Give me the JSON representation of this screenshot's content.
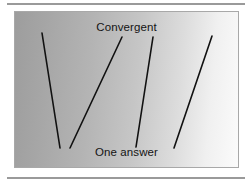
{
  "figure": {
    "type": "convergent-thinking-diagram",
    "top_label": "Convergent",
    "bottom_label": "One answer",
    "background": {
      "gradient_from": "#9d9d9d",
      "gradient_to": "#fbfbfb",
      "border_color": "#a8a8a8"
    },
    "rules": {
      "color": "#9a9a9a",
      "top_label_text": "",
      "bottom_label_text": ""
    },
    "lines": {
      "color": "#111111",
      "width": 1.6,
      "items": [
        {
          "name": "line-1",
          "x1": 27,
          "y1": 21,
          "x2": 45,
          "y2": 136
        },
        {
          "name": "line-2",
          "x1": 107,
          "y1": 25,
          "x2": 55,
          "y2": 136
        },
        {
          "name": "line-3",
          "x1": 138,
          "y1": 25,
          "x2": 121,
          "y2": 135
        },
        {
          "name": "line-4",
          "x1": 197,
          "y1": 24,
          "x2": 159,
          "y2": 136
        }
      ]
    }
  }
}
